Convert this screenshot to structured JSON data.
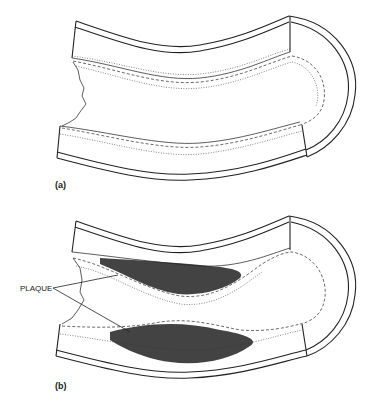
{
  "figure": {
    "panels": [
      {
        "id": "a",
        "label": "(a)",
        "description": "Healthy artery section"
      },
      {
        "id": "b",
        "label": "(b)",
        "description": "Artery section with plaque buildup"
      }
    ],
    "annotations": [
      {
        "text": "PLAQUE",
        "panel": "b",
        "pointers": 2
      }
    ]
  }
}
